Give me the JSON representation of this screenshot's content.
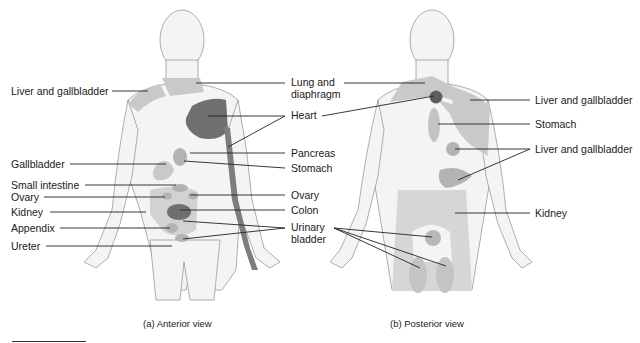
{
  "figure": {
    "colors": {
      "skin": "#f4f4f4",
      "outline": "#9a9a9a",
      "referred_light": "#c9c9c9",
      "referred_mid": "#b3b3b3",
      "referred_dark": "#6f6f6f",
      "leader_line": "#222222",
      "text": "#1a1a1a"
    },
    "anterior": {
      "caption": "(a) Anterior view",
      "labels_left": [
        "Liver and gallbladder",
        "Gallbladder",
        "Small intestine",
        "Ovary",
        "Kidney",
        "Appendix",
        "Ureter"
      ],
      "labels_right": [
        "Lung and",
        "diaphragm",
        "Heart",
        "Pancreas",
        "Stomach",
        "Ovary",
        "Colon",
        "Urinary",
        "bladder"
      ]
    },
    "posterior": {
      "caption": "(b) Posterior view",
      "labels_right": [
        "Liver and gallbladder",
        "Stomach",
        "Liver and gallbladder",
        "Kidney"
      ]
    }
  }
}
